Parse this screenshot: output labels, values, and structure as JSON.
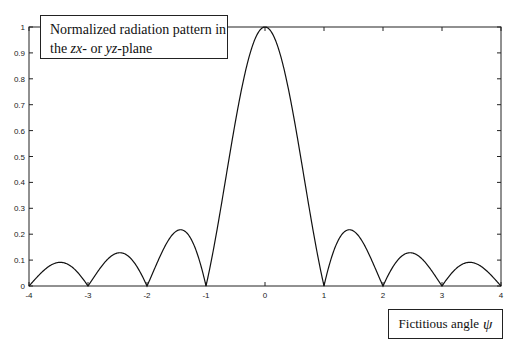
{
  "chart_data": {
    "type": "line",
    "title_line1": "Normalized radiation pattern in",
    "title_line2_pre": "the ",
    "title_line2_zx": "zx",
    "title_line2_mid": "- or ",
    "title_line2_yz": "yz",
    "title_line2_post": "-plane",
    "title": "Normalized radiation pattern in the zx- or yz-plane",
    "xlabel": "Fictitious angle ψ",
    "xlabel_text": "Fictitious angle",
    "xlabel_symbol": "ψ",
    "ylabel": "",
    "xlim": [
      -4,
      4
    ],
    "ylim": [
      0,
      1
    ],
    "xticks": [
      -4,
      -3,
      -2,
      -1,
      0,
      1,
      2,
      3,
      4
    ],
    "yticks": [
      0,
      0.1,
      0.2,
      0.3,
      0.4,
      0.5,
      0.6,
      0.7,
      0.8,
      0.9,
      1
    ],
    "grid": false,
    "series": [
      {
        "name": "|sin(πψ)/(πψ)|",
        "x": [
          -4,
          -3.47,
          -3,
          -2.46,
          -2,
          -1.43,
          -1,
          -0.5,
          0,
          0.5,
          1,
          1.43,
          2,
          2.46,
          3,
          3.47,
          4
        ],
        "values": [
          0,
          0.091,
          0,
          0.128,
          0,
          0.217,
          0,
          0.637,
          1,
          0.637,
          0,
          0.217,
          0,
          0.128,
          0,
          0.091,
          0
        ]
      }
    ],
    "annotations": [
      "Normalized radiation pattern in the zx- or yz-plane",
      "Fictitious angle ψ"
    ]
  }
}
